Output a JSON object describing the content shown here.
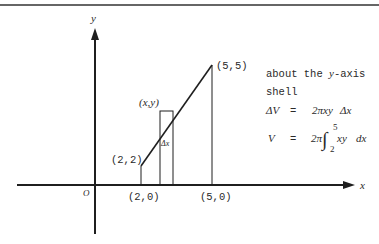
{
  "figure": {
    "axes": {
      "x_label": "x",
      "y_label": "y",
      "origin_label": "O"
    },
    "points": {
      "p22": "(2,2)",
      "p20": "(2,0)",
      "p55": "(5,5)",
      "p50": "(5,0)",
      "pxy": "(x,y)"
    },
    "strip_label": "Δx",
    "annotations": {
      "line1": "about the y-axis",
      "line1_prefix": "about the ",
      "line1_var": "y",
      "line1_suffix": "-axis",
      "line2": "shell",
      "line3_lhs": "ΔV",
      "line3_eq": "=",
      "line3_rhs_num": "2π",
      "line3_rhs_vars": "xy",
      "line3_rhs_dx": "Δx",
      "line4_lhs": "V",
      "line4_eq": "=",
      "line4_coef": "2π",
      "line4_integral": "∫",
      "line4_upper": "5",
      "line4_lower": "2",
      "line4_integrand": "xy",
      "line4_dx": "dx"
    },
    "colors": {
      "ink": "#1f1f1f",
      "background": "#ffffff"
    }
  }
}
